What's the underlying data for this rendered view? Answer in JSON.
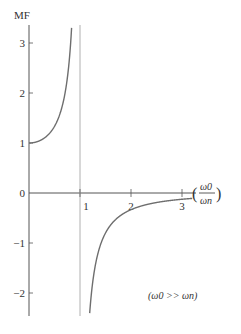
{
  "chart_data": {
    "type": "line",
    "title": "",
    "ylabel": "MF",
    "xlabel_num": "ω0",
    "xlabel_den": "ωn",
    "xlim": [
      0,
      3.4
    ],
    "ylim": [
      -2.5,
      3.4
    ],
    "xticks": [
      1,
      2,
      3
    ],
    "xtick_labels": [
      "1",
      "2",
      "3"
    ],
    "yticks": [
      3,
      2,
      1,
      0,
      -1,
      -2
    ],
    "ytick_labels": [
      "3",
      "2",
      "1",
      "0",
      "−1",
      "−2"
    ],
    "asymptote_x": 1,
    "function": "MF = 1 / (1 - r^2)",
    "series": [
      {
        "name": "lower-branch",
        "x": [
          0,
          0.2,
          0.4,
          0.5,
          0.6,
          0.7,
          0.8,
          0.85,
          0.9,
          0.92,
          0.94
        ],
        "y": [
          1.0,
          1.04,
          1.19,
          1.33,
          1.56,
          1.96,
          2.78,
          3.6,
          5.26,
          6.51,
          8.59
        ]
      },
      {
        "name": "upper-branch",
        "x": [
          1.09,
          1.1,
          1.2,
          1.4,
          1.6,
          1.8,
          2.0,
          2.4,
          2.8,
          3.0,
          3.2
        ],
        "y": [
          -5.35,
          -4.76,
          -2.27,
          -1.04,
          -0.64,
          -0.45,
          -0.33,
          -0.21,
          -0.15,
          -0.125,
          -0.11
        ]
      }
    ],
    "annotation": "(ω0 >> ωn)",
    "grid": false,
    "legend": "none",
    "colors": {
      "curve": "#6e6e6e",
      "axis": "#555555",
      "asymptote": "#b0b0b0"
    }
  }
}
